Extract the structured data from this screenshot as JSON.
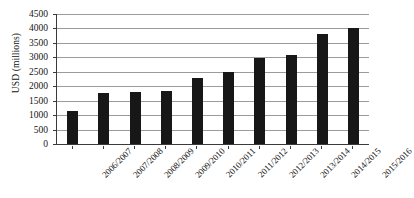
{
  "chart_data": {
    "type": "bar",
    "title": "",
    "subtitle": "",
    "xlabel": "",
    "ylabel": "USD (millions)",
    "categories": [
      "2006/2007",
      "2007/2008",
      "2008/2009",
      "2009/2010",
      "2010/2011",
      "2011/2012",
      "2012/2013",
      "2013/2014",
      "2014/2015",
      "2015/2016"
    ],
    "values": [
      1150,
      1750,
      1800,
      1850,
      2300,
      2480,
      2980,
      3080,
      3800,
      4030
    ],
    "ylim": [
      0,
      4500
    ],
    "ytick_labels": [
      "0",
      "500",
      "1000",
      "1500",
      "2000",
      "2500",
      "3000",
      "3500",
      "4000",
      "4500"
    ],
    "ytick_values": [
      0,
      500,
      1000,
      1500,
      2000,
      2500,
      3000,
      3500,
      4000,
      4500
    ],
    "grid": true,
    "grid_axis": "y",
    "legend": false,
    "legend_position": "none",
    "bar_color": "#171717",
    "grid_color": "#9b9b9b",
    "axis_color": "#3a3a3a",
    "background_color": "#ffffff",
    "xtick_label_rotation": -45
  }
}
